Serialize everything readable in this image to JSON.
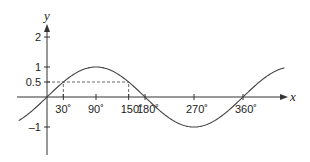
{
  "chart_data": {
    "type": "line",
    "title": "",
    "xlabel": "x",
    "ylabel": "y",
    "series": [
      {
        "name": "y = sin x",
        "function": "sin",
        "x_range_deg": [
          -52,
          436
        ]
      }
    ],
    "x_ticks": [
      {
        "value": 30,
        "label": "30˚"
      },
      {
        "value": 90,
        "label": "90˚"
      },
      {
        "value": 150,
        "label": "150˚"
      },
      {
        "value": 180,
        "label": "180˚"
      },
      {
        "value": 270,
        "label": "270˚"
      },
      {
        "value": 360,
        "label": "360˚"
      }
    ],
    "y_ticks": [
      {
        "value": 2,
        "label": "2"
      },
      {
        "value": 1,
        "label": "1"
      },
      {
        "value": 0.5,
        "label": "0.5"
      },
      {
        "value": -1,
        "label": "–1"
      }
    ],
    "annotations": [
      {
        "type": "dashed-line",
        "y": 0.5,
        "from_x": 0,
        "to_x": 150
      },
      {
        "type": "dashed-line",
        "x": 30,
        "from_y": 0,
        "to_y": 0.5
      },
      {
        "type": "dashed-line",
        "x": 150,
        "from_y": 0,
        "to_y": 0.5
      }
    ],
    "xlim": [
      -55,
      440
    ],
    "ylim": [
      -1.9,
      2.4
    ],
    "grid": false,
    "legend": "none"
  },
  "colors": {
    "axis": "#333333",
    "curve": "#444444",
    "dash": "#555555"
  }
}
